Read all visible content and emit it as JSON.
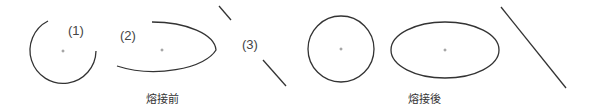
{
  "figure": {
    "before": {
      "caption": "熔接前",
      "shapes": [
        {
          "id": "1",
          "label": "(1)",
          "type": "open-circle-arc"
        },
        {
          "id": "2",
          "label": "(2)",
          "type": "open-ellipse-arc"
        },
        {
          "id": "3",
          "label": "(3)",
          "type": "broken-line"
        }
      ]
    },
    "after": {
      "caption": "熔接後",
      "shapes": [
        {
          "id": "1",
          "type": "closed-circle"
        },
        {
          "id": "2",
          "type": "closed-ellipse"
        },
        {
          "id": "3",
          "type": "continuous-line"
        }
      ]
    },
    "colors": {
      "stroke": "#333333",
      "text": "#444444",
      "background": "#ffffff"
    }
  }
}
